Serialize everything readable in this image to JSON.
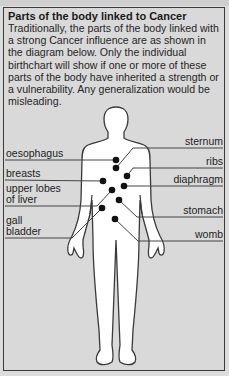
{
  "title": "Parts of the body linked to Cancer",
  "intro": "Traditionally, the parts of the body linked with a strong Cancer influence are as shown in the diagram below. Only the individual birthchart will show if one or more of these parts of the body have inherited a strength or a vulnerability. Any generalization would be misleading.",
  "labels_left": [
    {
      "id": "oesophagus",
      "text": "oesophagus"
    },
    {
      "id": "breasts",
      "text": "breasts"
    },
    {
      "id": "upper-lobes-of-liver",
      "line1": "upper lobes",
      "line2": "of liver"
    },
    {
      "id": "gall-bladder",
      "line1": "gall",
      "line2": "bladder"
    }
  ],
  "labels_right": [
    {
      "id": "sternum",
      "text": "sternum"
    },
    {
      "id": "ribs",
      "text": "ribs"
    },
    {
      "id": "diaphragm",
      "text": "diaphragm"
    },
    {
      "id": "stomach",
      "text": "stomach"
    },
    {
      "id": "womb",
      "text": "womb"
    }
  ],
  "colors": {
    "background": "#d9d9d9",
    "body_fill": "#ffffff",
    "outline": "#3a3a3a",
    "dot": "#111111"
  }
}
